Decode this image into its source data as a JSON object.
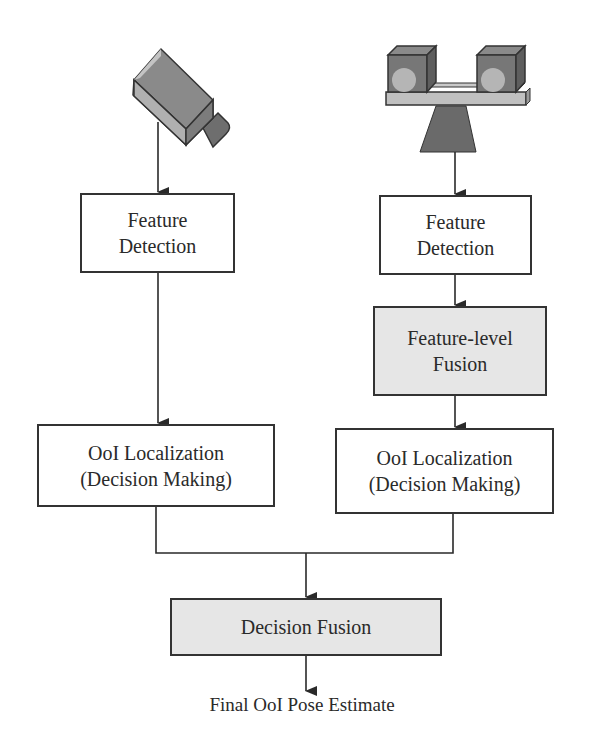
{
  "diagram": {
    "type": "flowchart",
    "colors": {
      "line": "#333333",
      "box_fill": "#ffffff",
      "fusion_fill": "#e6e6e6",
      "camera_body": "#a9a9a9",
      "camera_dark": "#6e6e6e",
      "stereo_base": "#6a6a6a"
    },
    "left_branch": {
      "sensor_icon": "single-camera-icon",
      "feature_detection": {
        "line1": "Feature",
        "line2": "Detection"
      },
      "localization": {
        "line1": "OoI Localization",
        "line2": "(Decision Making)"
      }
    },
    "right_branch": {
      "sensor_icon": "stereo-camera-icon",
      "feature_detection": {
        "line1": "Feature",
        "line2": "Detection"
      },
      "feature_fusion": {
        "line1": "Feature-level",
        "line2": "Fusion"
      },
      "localization": {
        "line1": "OoI Localization",
        "line2": "(Decision Making)"
      }
    },
    "decision_fusion": {
      "label": "Decision Fusion"
    },
    "output": {
      "label": "Final OoI Pose Estimate"
    }
  }
}
